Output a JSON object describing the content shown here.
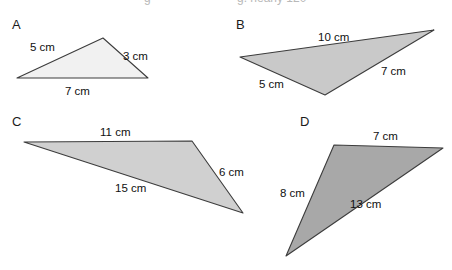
{
  "page": {
    "width": 452,
    "height": 270,
    "background": "#ffffff",
    "stroke_color": "#3a3a3a"
  },
  "clipped_header": {
    "fragment_left": "g",
    "fragment_right": "g. nearly 120°"
  },
  "figures": [
    {
      "id": "A",
      "label": "A",
      "label_x": 12,
      "label_y": 29,
      "fill": "#f1f1f1",
      "stroke": "#3c3c3c",
      "points": "17,78 103,38 148,78",
      "sides": [
        {
          "name": "side-5cm",
          "text": "5 cm",
          "x": 30,
          "y": 51
        },
        {
          "name": "side-3cm",
          "text": "3 cm",
          "x": 123,
          "y": 60
        },
        {
          "name": "side-7cm",
          "text": "7 cm",
          "x": 65,
          "y": 95
        }
      ]
    },
    {
      "id": "B",
      "label": "B",
      "label_x": 236,
      "label_y": 29,
      "fill": "#c9c9c9",
      "stroke": "#3c3c3c",
      "points": "240,57 434,30 325,95",
      "sides": [
        {
          "name": "side-10cm",
          "text": "10 cm",
          "x": 318,
          "y": 41
        },
        {
          "name": "side-7cm",
          "text": "7 cm",
          "x": 381,
          "y": 75
        },
        {
          "name": "side-5cm",
          "text": "5 cm",
          "x": 259,
          "y": 88
        }
      ]
    },
    {
      "id": "C",
      "label": "C",
      "label_x": 12,
      "label_y": 126,
      "fill": "#d0d0d0",
      "stroke": "#3c3c3c",
      "points": "24,142 192,141 243,213",
      "sides": [
        {
          "name": "side-11cm",
          "text": "11 cm",
          "x": 100,
          "y": 136
        },
        {
          "name": "side-6cm",
          "text": "6 cm",
          "x": 219,
          "y": 176
        },
        {
          "name": "side-15cm",
          "text": "15 cm",
          "x": 115,
          "y": 192
        }
      ]
    },
    {
      "id": "D",
      "label": "D",
      "label_x": 300,
      "label_y": 126,
      "fill": "#a8a8a8",
      "stroke": "#3c3c3c",
      "points": "334,145 443,148 286,256",
      "sides": [
        {
          "name": "side-7cm",
          "text": "7 cm",
          "x": 373,
          "y": 140
        },
        {
          "name": "side-8cm",
          "text": "8 cm",
          "x": 280,
          "y": 197
        },
        {
          "name": "side-13cm",
          "text": "13 cm",
          "x": 350,
          "y": 208
        }
      ]
    }
  ]
}
